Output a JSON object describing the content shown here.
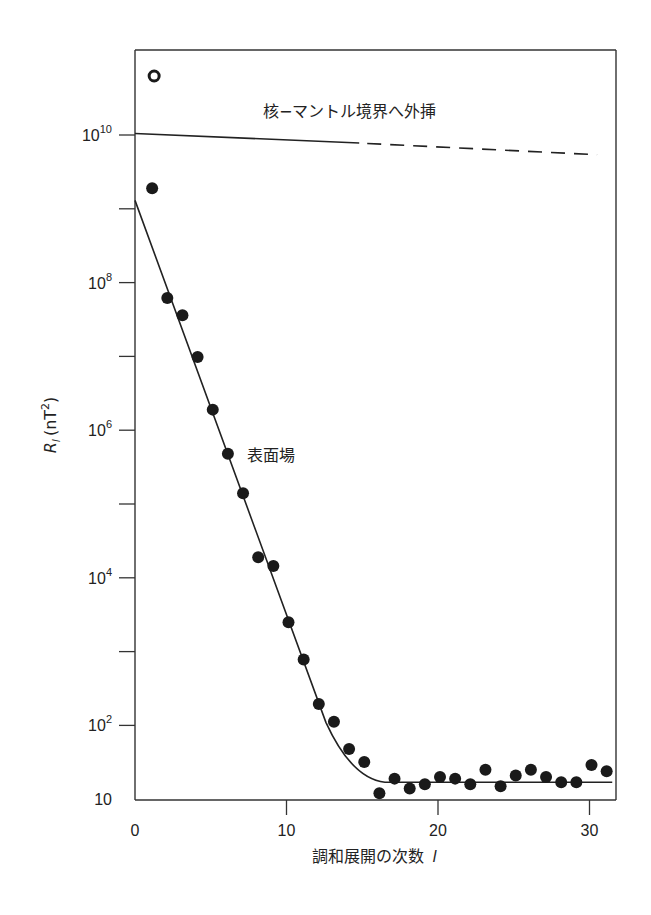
{
  "chart_data": {
    "type": "scatter",
    "title": "",
    "xlabel": "調和展開の次数 l",
    "xlabel_main": "調和展開の次数",
    "xlabel_var": "l",
    "ylabel": "R_l (nT^2)",
    "ylabel_main": "R",
    "ylabel_sub": "l",
    "ylabel_unit": "(nT",
    "ylabel_unit_exp": "2",
    "ylabel_unit_close": ")",
    "xlim": [
      0,
      32
    ],
    "ylim_log10": [
      1,
      11
    ],
    "yscale": "log",
    "grid": false,
    "x_ticks": [
      {
        "value": 0,
        "label": "0"
      },
      {
        "value": 10,
        "label": "10"
      },
      {
        "value": 20,
        "label": "20"
      },
      {
        "value": 30,
        "label": "30"
      }
    ],
    "y_ticks": [
      {
        "log10": 10,
        "base": "10",
        "exp": "10"
      },
      {
        "log10": 9,
        "base": "",
        "exp": ""
      },
      {
        "log10": 8,
        "base": "10",
        "exp": "8"
      },
      {
        "log10": 7,
        "base": "",
        "exp": ""
      },
      {
        "log10": 6,
        "base": "10",
        "exp": "6"
      },
      {
        "log10": 5,
        "base": "",
        "exp": ""
      },
      {
        "log10": 4,
        "base": "10",
        "exp": "4"
      },
      {
        "log10": 3,
        "base": "",
        "exp": ""
      },
      {
        "log10": 2,
        "base": "10",
        "exp": "2"
      },
      {
        "log10": 1,
        "base": "10",
        "exp": ""
      }
    ],
    "series": [
      {
        "name": "表面場 (surface field) observed",
        "marker": "filled-circle",
        "x": [
          1,
          2,
          3,
          4,
          5,
          6,
          7,
          8,
          9,
          10,
          11,
          12,
          13,
          14,
          15,
          16,
          17,
          18,
          19,
          20,
          21,
          22,
          23,
          24,
          25,
          26,
          27,
          28,
          29,
          30,
          31
        ],
        "values": [
          1900000000.0,
          62000000.0,
          36000000.0,
          9800000.0,
          1900000.0,
          480000.0,
          140000.0,
          19000.0,
          14500.0,
          2500.0,
          780,
          195,
          112,
          48,
          32,
          12,
          19,
          14,
          16,
          20,
          19,
          16,
          25,
          15,
          21,
          25,
          20,
          17,
          17,
          29,
          24
        ]
      },
      {
        "name": "dipole (open circle)",
        "marker": "open-circle",
        "x": [
          1
        ],
        "values": [
          63000000000.0
        ]
      },
      {
        "name": "表面場 fit (core field)",
        "type": "line",
        "x": [
          0,
          14.8,
          31.5
        ],
        "values": [
          1300000000.0,
          17,
          17
        ],
        "shape": "steep straight decline then flat noise floor ≈17"
      },
      {
        "name": "核-マントル境界へ外挿",
        "type": "line",
        "x": [
          0,
          14.8,
          30.5
        ],
        "values": [
          10500000000.0,
          7800000000.0,
          5400000000.0
        ],
        "style": "solid until l≈15 then dashed"
      }
    ],
    "annotations": [
      {
        "text": "核−マントル境界へ外挿",
        "x": 9.5,
        "y": 14000000000.0
      },
      {
        "text": "表面場",
        "x": 7.7,
        "y": 450000.0
      }
    ],
    "legend": null
  }
}
